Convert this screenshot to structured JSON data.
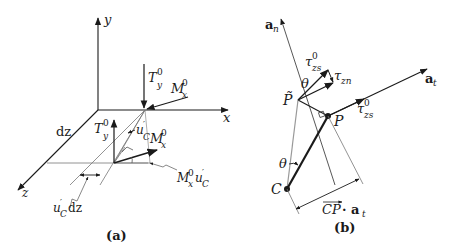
{
  "panel_a": {
    "caption": "(a)",
    "axes": {
      "x": "x",
      "y": "y",
      "z": "z"
    },
    "labels": {
      "T": "T",
      "Ty_sup": "0",
      "Ty_sub": "y",
      "M": "M",
      "Mx_sup": "0",
      "Mx_sub": "x",
      "u": "u",
      "uC_prime": "′",
      "uC_sub": "C",
      "dz": "dz",
      "uCdz_tail": "dz",
      "MxuC_tail": "u"
    }
  },
  "panel_b": {
    "caption": "(b)",
    "labels": {
      "an_main": "a",
      "an_sub": "n",
      "at_main": "a",
      "at_sub": "t",
      "tau": "τ",
      "tau_zs_sub": "zs",
      "tau_zs_sup": "0",
      "tau_zn_sub": "zn",
      "theta": "θ",
      "P_tilde": "P̃",
      "P": "P",
      "C": "C",
      "CP": "CP",
      "dot_at": " · a",
      "dot_at_sub": "t"
    }
  },
  "colors": {
    "ink": "#1a1a1a",
    "thin_line": "#555555",
    "light_line": "#888888"
  }
}
